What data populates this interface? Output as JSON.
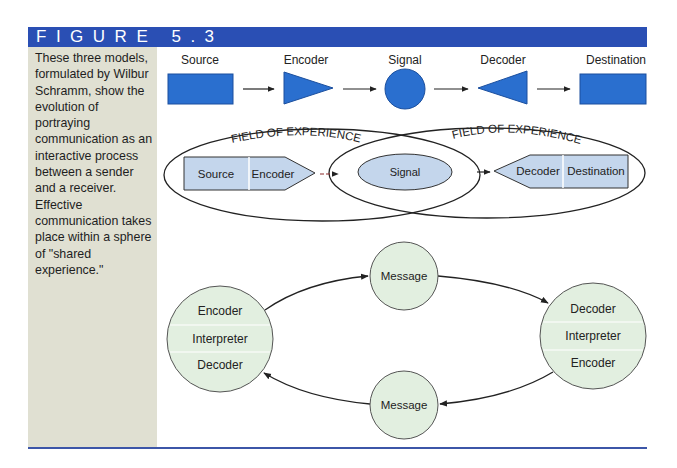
{
  "figure": {
    "title": "FIGURE 5.3",
    "caption": "These three models, formulated by Wilbur Schramm, show the evolution of portraying communication as an interactive process between a sender and a receiver. Effective communication takes place within a sphere of \"shared experience.\""
  },
  "colors": {
    "header_bg": "#2a4fb4",
    "sidebar_bg": "#e0e0d2",
    "shape_blue": "#2a6fcf",
    "light_blue_fill": "#c4d6ec",
    "circle_fill": "#e2efe0",
    "rule": "#3c56a8"
  },
  "model1": {
    "labels": {
      "source": "Source",
      "encoder": "Encoder",
      "signal": "Signal",
      "decoder": "Decoder",
      "destination": "Destination"
    }
  },
  "model2": {
    "field_left": "FIELD OF EXPERIENCE",
    "field_right": "FIELD OF EXPERIENCE",
    "source": "Source",
    "encoder": "Encoder",
    "signal": "Signal",
    "decoder": "Decoder",
    "destination": "Destination"
  },
  "model3": {
    "left_circle": [
      "Encoder",
      "Interpreter",
      "Decoder"
    ],
    "right_circle": [
      "Decoder",
      "Interpreter",
      "Encoder"
    ],
    "message_top": "Message",
    "message_bottom": "Message"
  }
}
